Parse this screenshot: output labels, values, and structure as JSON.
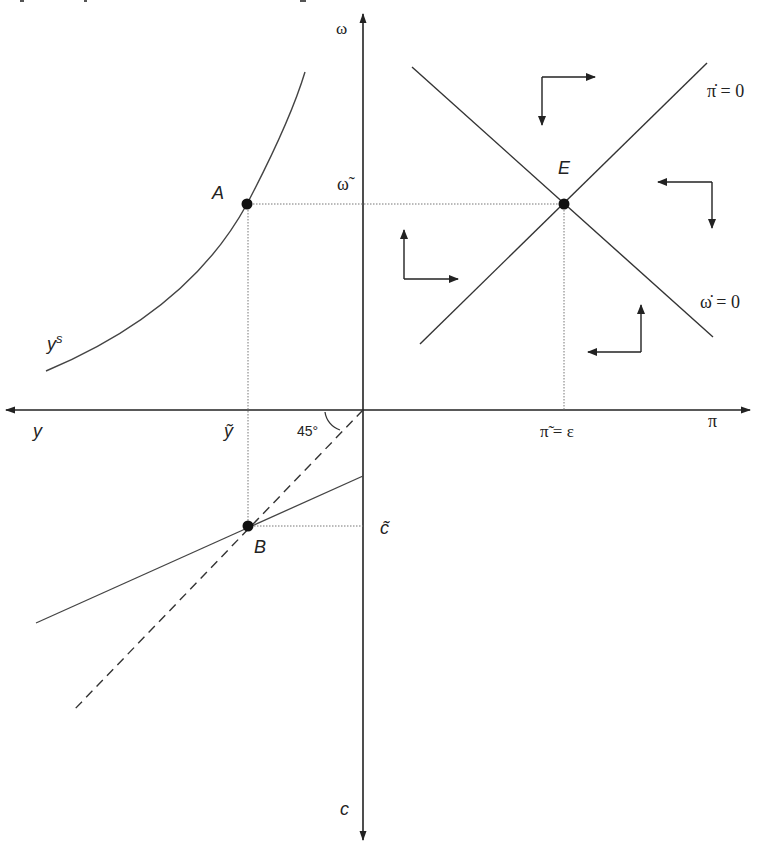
{
  "diagram": {
    "colors": {
      "line": "#444444",
      "axis": "#222222",
      "dot": "#111111",
      "guide": "#777777",
      "background": "#ffffff"
    },
    "axes": {
      "up": "ω",
      "right": "π",
      "left": "y",
      "down": "c"
    },
    "points": {
      "A": {
        "label": "A",
        "x": 247,
        "y": 204
      },
      "E": {
        "label": "E",
        "x": 564,
        "y": 204
      },
      "B": {
        "label": "B",
        "x": 248,
        "y": 526
      }
    },
    "tick_labels": {
      "omega_tilde": "ω̃",
      "y_tilde": "ỹ",
      "pi_tilde_eq": "π̃ = ε",
      "c_tilde": "c̃",
      "angle": "45°"
    },
    "curves": {
      "labor_supply": "y",
      "labor_supply_superscript": "s",
      "pi_dot_nullcline": "π̇ = 0",
      "omega_dot_nullcline": "ω̇ = 0"
    },
    "phase_arrows": [
      {
        "region": "top",
        "horizontal": "right",
        "vertical": "down"
      },
      {
        "region": "right",
        "horizontal": "left",
        "vertical": "down"
      },
      {
        "region": "left",
        "horizontal": "right",
        "vertical": "up"
      },
      {
        "region": "bottom",
        "horizontal": "left",
        "vertical": "up"
      }
    ]
  }
}
